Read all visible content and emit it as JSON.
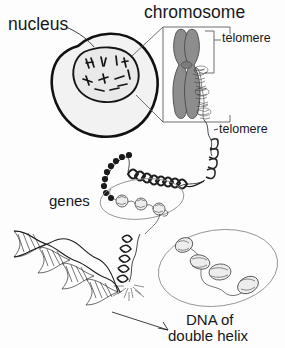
{
  "figure": {
    "labels": {
      "nucleus": "nucleus",
      "chromosome": "chromosome",
      "telomere_top": "telomere",
      "telomere_bottom": "telomere",
      "genes": "genes",
      "dna_caption_line1": "DNA of",
      "dna_caption_line2": "double helix"
    },
    "colors": {
      "background": "#fdfdfd",
      "ink": "#1d1d1d",
      "text": "#17171a",
      "cell_fill": "#f2f2f2",
      "nucleus_fill": "#e9e9e9",
      "chromatid_fill": "#8d8d8d",
      "leader_line": "#5d5d5d"
    },
    "elements": {
      "cell": "cell-outline",
      "nucleus": "nucleus-outline",
      "nucleus_chromosomes": "scattered-chromosomes",
      "chromosome_inset": "chromosome-inset-box",
      "chromatid_pair": "x-shaped-chromosome",
      "telomere_bracket": "telomere-bracket",
      "chromatin_fiber": "condensed-chromatin-fiber",
      "solenoid_coil": "solenoid-coil",
      "beads_on_string": "nucleosome-beads",
      "gene_magnifier": "gene-magnifier-oval",
      "histone_oval": "histone-detail-oval",
      "double_helix": "dna-double-helix",
      "caption_arrow": "dna-caption-arrow"
    }
  }
}
